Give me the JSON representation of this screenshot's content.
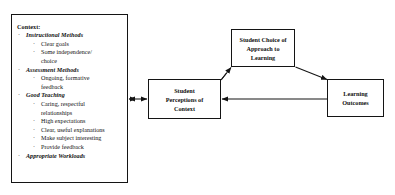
{
  "diagram": {
    "context_panel": {
      "name": "context-panel",
      "heading": "Context:",
      "groups": [
        {
          "label": "Instructional Methods",
          "items": [
            "Clear goals",
            "Some independence/",
            "choice"
          ]
        },
        {
          "label": "Assessment Methods",
          "items": [
            "Ongoing, formative",
            "feedback"
          ]
        },
        {
          "label": "Good Teaching",
          "items": [
            "Caring, respectful",
            "relationships",
            "High expectations",
            "Clear, useful explanations",
            "Make subject interesting",
            "Provide feedback"
          ]
        },
        {
          "label": "Appropriate Workloads",
          "items": []
        }
      ]
    },
    "nodes": [
      {
        "id": "perceptions",
        "lines": [
          "Student",
          "Perceptions of",
          "Context"
        ]
      },
      {
        "id": "choice",
        "lines": [
          "Student Choice of",
          "Approach to",
          "Learning"
        ]
      },
      {
        "id": "outcomes",
        "lines": [
          "Learning",
          "Outcomes"
        ]
      }
    ],
    "connectors": [
      {
        "id": "context-to-perceptions",
        "from": "context-panel",
        "to": "perceptions",
        "style": "double-arrow-horizontal"
      },
      {
        "id": "perceptions-to-choice",
        "from": "perceptions",
        "to": "choice",
        "style": "arrow-diagonal-up-right"
      },
      {
        "id": "choice-to-outcomes",
        "from": "choice",
        "to": "outcomes",
        "style": "arrow-diagonal-down-right"
      },
      {
        "id": "outcomes-to-perceptions",
        "from": "outcomes",
        "to": "perceptions",
        "style": "arrow-horizontal-left"
      }
    ],
    "colors": {
      "stroke": "#141414",
      "background": "#ffffff",
      "text": "#111111"
    }
  }
}
